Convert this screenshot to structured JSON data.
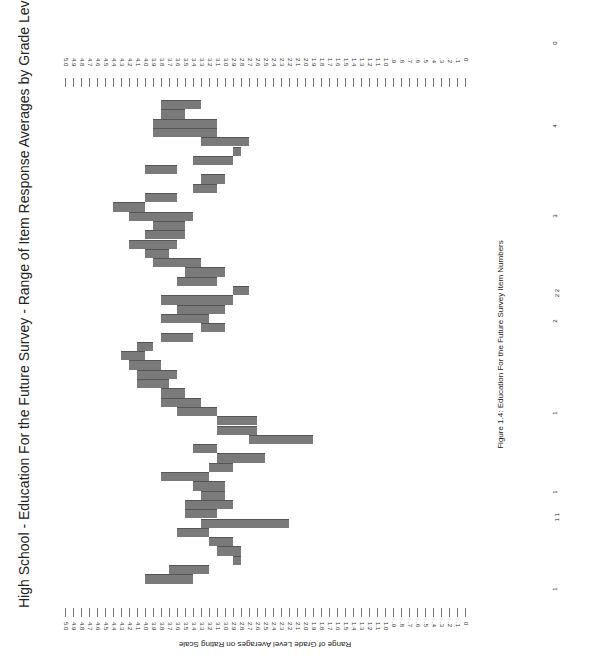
{
  "title": "High School - Education For the Future Survey - Range of Item Response Averages by Grade Level",
  "axis_title": "Range of Grade Level Averages on Rating Scale",
  "caption": "Figure 1.4:     Education For the Future Survey Item Numbers",
  "tick_labels": [
    "5.0",
    "4.9",
    "4.8",
    "4.7",
    "4.6",
    "4.5",
    "4.4",
    "4.3",
    "4.2",
    "4.1",
    "4.0",
    "3.9",
    "3.8",
    "3.7",
    "3.6",
    "3.5",
    "3.4",
    "3.3",
    "3.2",
    "3.1",
    "3.0",
    "2.9",
    "2.8",
    "2.7",
    "2.6",
    "2.5",
    "2.4",
    "2.3",
    "2.2",
    "2.1",
    "2.0",
    "1.9",
    "1.8",
    "1.7",
    "1.6",
    "1.5",
    "1.4",
    "1.3",
    "1.2",
    "1.1",
    "1.0",
    ".9",
    ".8",
    ".7",
    ".6",
    ".5",
    ".4",
    ".3",
    ".2",
    ".1",
    "0"
  ],
  "item_labels": [
    {
      "text": "1",
      "y": 586
    },
    {
      "text": "1 1",
      "y": 514
    },
    {
      "text": "1",
      "y": 489
    },
    {
      "text": "1",
      "y": 410
    },
    {
      "text": "2",
      "y": 318
    },
    {
      "text": "2 2",
      "y": 290
    },
    {
      "text": "3",
      "y": 213
    },
    {
      "text": "4",
      "y": 123
    },
    {
      "text": "0",
      "y": 40
    }
  ],
  "chart_data": {
    "type": "bar",
    "subtype": "floating-range-horizontal (page rotated 90°)",
    "title": "High School - Education For the Future Survey - Range of Item Response Averages by Grade Level",
    "xlabel": "Education For the Future Survey Item Numbers",
    "ylabel": "Range of Grade Level Averages on Rating Scale",
    "ylim": [
      0,
      5.0
    ],
    "tick_step": 0.1,
    "grid": false,
    "legend": null,
    "note": "Each bar shows [low, high] range of grade-level averages for one survey item; items ordered top-to-bottom in rotated page.",
    "bars": [
      {
        "low": 3.3,
        "high": 3.8
      },
      {
        "low": 3.5,
        "high": 3.8
      },
      {
        "low": 3.1,
        "high": 3.9
      },
      {
        "low": 3.1,
        "high": 3.9
      },
      {
        "low": 2.7,
        "high": 3.3
      },
      {
        "low": 2.8,
        "high": 2.9
      },
      {
        "low": 2.9,
        "high": 3.4
      },
      {
        "low": 3.6,
        "high": 4.0
      },
      {
        "low": 3.0,
        "high": 3.3
      },
      {
        "low": 3.1,
        "high": 3.4
      },
      {
        "low": 3.6,
        "high": 4.0
      },
      {
        "low": 4.0,
        "high": 4.4
      },
      {
        "low": 3.4,
        "high": 4.2
      },
      {
        "low": 3.5,
        "high": 3.9
      },
      {
        "low": 3.5,
        "high": 4.0
      },
      {
        "low": 3.6,
        "high": 4.2
      },
      {
        "low": 3.7,
        "high": 4.0
      },
      {
        "low": 3.3,
        "high": 3.9
      },
      {
        "low": 3.0,
        "high": 3.5
      },
      {
        "low": 3.1,
        "high": 3.6
      },
      {
        "low": 2.7,
        "high": 2.9
      },
      {
        "low": 2.9,
        "high": 3.8
      },
      {
        "low": 3.0,
        "high": 3.6
      },
      {
        "low": 3.2,
        "high": 3.8
      },
      {
        "low": 3.0,
        "high": 3.3
      },
      {
        "low": 3.4,
        "high": 3.8
      },
      {
        "low": 3.9,
        "high": 4.1
      },
      {
        "low": 4.0,
        "high": 4.3
      },
      {
        "low": 3.8,
        "high": 4.2
      },
      {
        "low": 3.6,
        "high": 4.1
      },
      {
        "low": 3.7,
        "high": 4.1
      },
      {
        "low": 3.5,
        "high": 3.8
      },
      {
        "low": 3.3,
        "high": 3.8
      },
      {
        "low": 3.1,
        "high": 3.6
      },
      {
        "low": 2.6,
        "high": 3.1
      },
      {
        "low": 2.6,
        "high": 3.1
      },
      {
        "low": 1.9,
        "high": 2.7
      },
      {
        "low": 3.1,
        "high": 3.4
      },
      {
        "low": 2.5,
        "high": 3.1
      },
      {
        "low": 2.9,
        "high": 3.2
      },
      {
        "low": 3.2,
        "high": 3.8
      },
      {
        "low": 3.0,
        "high": 3.4
      },
      {
        "low": 3.0,
        "high": 3.3
      },
      {
        "low": 2.9,
        "high": 3.5
      },
      {
        "low": 3.1,
        "high": 3.5
      },
      {
        "low": 2.2,
        "high": 3.3
      },
      {
        "low": 3.2,
        "high": 3.6
      },
      {
        "low": 2.9,
        "high": 3.2
      },
      {
        "low": 2.8,
        "high": 3.1
      },
      {
        "low": 2.8,
        "high": 2.9
      },
      {
        "low": 3.2,
        "high": 3.7
      },
      {
        "low": 3.4,
        "high": 4.0
      }
    ]
  }
}
